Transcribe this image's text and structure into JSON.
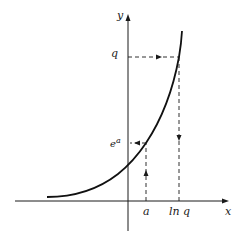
{
  "diagram": {
    "type": "graph of exponential function with inverse (logarithm) mapping",
    "axes": {
      "x_label": "x",
      "y_label": "y"
    },
    "curve": {
      "description": "y = e^x"
    },
    "y_axis_labels": {
      "q": "q",
      "e_a_base": "e",
      "e_a_exp": "a"
    },
    "x_axis_labels": {
      "a": "a",
      "ln_q": "ln q"
    },
    "mappings": [
      {
        "from": "a on x-axis",
        "to": "e^a on y-axis",
        "direction": "up then left"
      },
      {
        "from": "q on y-axis",
        "to": "ln q on x-axis",
        "direction": "right then down"
      }
    ],
    "colors": {
      "ink": "#1a1a1a",
      "background": "#ffffff"
    }
  }
}
